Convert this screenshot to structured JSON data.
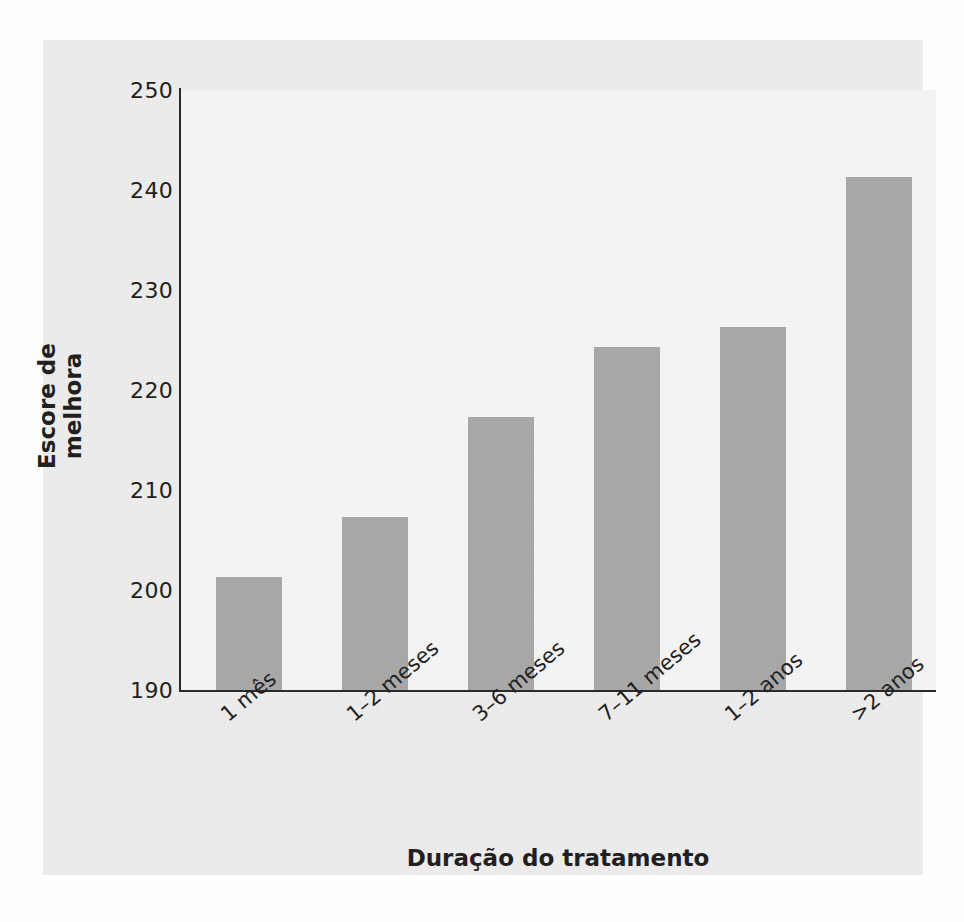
{
  "chart_data": {
    "type": "bar",
    "title": "",
    "xlabel": "Duração do tratamento",
    "ylabel": "Escore de melhora",
    "categories": [
      "1 mês",
      "1–2 meses",
      "3–6 meses",
      "7–11 meses",
      "1–2 anos",
      ">2 anos"
    ],
    "values": [
      201.3,
      207.3,
      217.3,
      224.3,
      226.3,
      241.3
    ],
    "ylim": [
      190,
      250
    ],
    "yticks": [
      250,
      240,
      230,
      220,
      210,
      200,
      190
    ],
    "ytick_labels": [
      "250",
      "240",
      "230",
      "220",
      "210",
      "200",
      "190"
    ],
    "grid": false,
    "legend": null,
    "series": [
      {
        "name": "Escore de melhora",
        "values": [
          201.3,
          207.3,
          217.3,
          224.3,
          226.3,
          241.3
        ]
      }
    ]
  },
  "style": {
    "bar_color": "#a8a8a8",
    "figure_background": "#ececec",
    "plot_background": "#f4f4f4",
    "axis_color": "#2b2b2b",
    "text_color": "#231f20"
  },
  "caption": {
    "mark": ""
  }
}
